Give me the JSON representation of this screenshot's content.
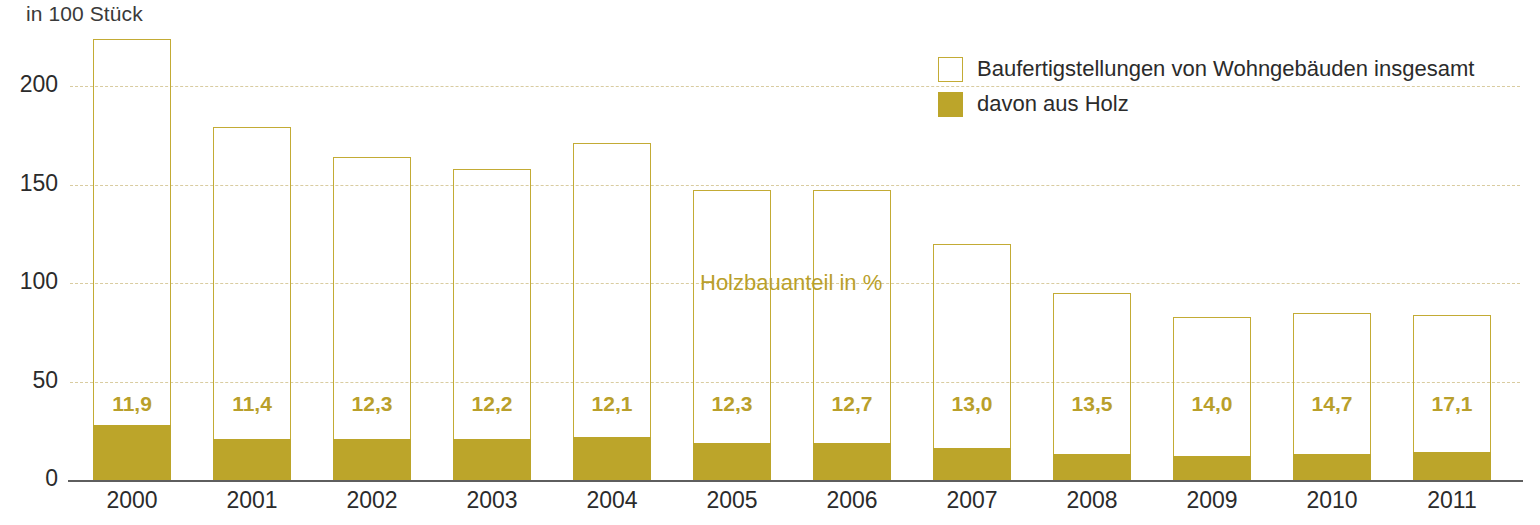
{
  "unit_label": "in 100 Stück",
  "annotation": "Holzbauanteil in %",
  "legend": {
    "items": [
      {
        "label": "Baufertigstellungen von Wohngebäuden insgesamt",
        "swatch": "open",
        "color": "#ffffff"
      },
      {
        "label": "davon aus Holz",
        "swatch": "filled",
        "color": "#bca52a"
      }
    ]
  },
  "colors": {
    "wood_fill": "#bca52a",
    "outline": "#c3ab35",
    "grid": "#d9cca0",
    "axis": "#5e5e5e",
    "label_text": "#2b2b2b",
    "pct_text": "#b99f2b"
  },
  "chart_data": {
    "type": "bar",
    "title": "",
    "subtitle": "",
    "xlabel": "",
    "ylabel": "in 100 Stück",
    "ylim": [
      0,
      230
    ],
    "yticks": [
      0,
      50,
      100,
      150,
      200
    ],
    "grid": true,
    "legend_position": "top-right",
    "stacked": true,
    "categories": [
      "2000",
      "2001",
      "2002",
      "2003",
      "2004",
      "2005",
      "2006",
      "2007",
      "2008",
      "2009",
      "2010",
      "2011"
    ],
    "series": [
      {
        "name": "Baufertigstellungen von Wohngebäuden insgesamt",
        "values": [
          224,
          179,
          164,
          158,
          171,
          147,
          147,
          120,
          95,
          83,
          85,
          84
        ]
      },
      {
        "name": "davon aus Holz",
        "values": [
          28,
          21,
          21,
          21,
          22,
          19,
          19,
          16,
          13,
          12,
          13,
          14
        ]
      }
    ],
    "data_labels": {
      "name": "Holzbauanteil in %",
      "values": [
        "11,9",
        "11,4",
        "12,3",
        "12,2",
        "12,1",
        "12,3",
        "12,7",
        "13,0",
        "13,5",
        "14,0",
        "14,7",
        "17,1"
      ]
    }
  }
}
